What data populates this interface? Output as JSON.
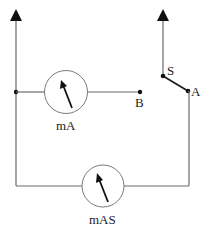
{
  "diagram": {
    "type": "circuit",
    "labels": {
      "meter_top": "mA",
      "meter_bottom": "mAS",
      "point_b": "B",
      "point_s": "S",
      "point_a": "A"
    },
    "components": [
      {
        "id": "meter_top",
        "kind": "ammeter",
        "label": "mA"
      },
      {
        "id": "meter_bottom",
        "kind": "ammeter",
        "label": "mAS"
      },
      {
        "id": "switch",
        "kind": "switch",
        "terminals": [
          "S",
          "A"
        ]
      },
      {
        "id": "terminal_b",
        "kind": "open-terminal",
        "label": "B"
      }
    ],
    "colors": {
      "wire": "#6a6a6a",
      "ink": "#111111",
      "background": "#ffffff"
    }
  }
}
